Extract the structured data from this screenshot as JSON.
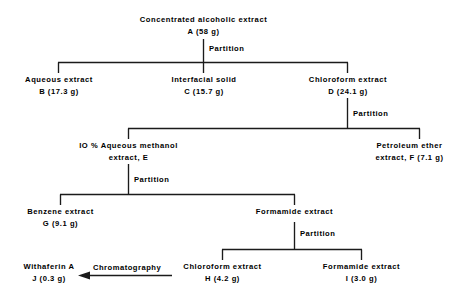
{
  "diagram": {
    "line_color": "#1b1b1b",
    "background": "#ffffff",
    "nodes": [
      {
        "id": "A",
        "line1": "Concentrated  alcoholic  extract",
        "line2": "A (58 g)"
      },
      {
        "id": "B",
        "line1": "Aqueous  extract",
        "line2": "B  (17.3 g)"
      },
      {
        "id": "C",
        "line1": "Interfacial  solid",
        "line2": "C  (15.7 g)"
      },
      {
        "id": "D",
        "line1": "Chloroform  extract",
        "line2": "D  (24.1 g)"
      },
      {
        "id": "E",
        "line1": "IO %  Aqueous  methanol",
        "line2": "extract,   E"
      },
      {
        "id": "F",
        "line1": "Petroleum  ether",
        "line2": "extract,   F  (7.1 g)"
      },
      {
        "id": "G",
        "line1": "Benzene  extract",
        "line2": "G  (9.1 g)"
      },
      {
        "id": "FORM",
        "line1": "Formamide  extract",
        "line2": ""
      },
      {
        "id": "H",
        "line1": "Chloroform  extract",
        "line2": "H  (4.2 g)"
      },
      {
        "id": "I",
        "line1": "Formamide  extract",
        "line2": "I  (3.0 g)"
      },
      {
        "id": "J",
        "line1": "Withaferin  A",
        "line2": "J  (0.3 g)"
      }
    ],
    "edge_labels": {
      "partition_1": "Partition",
      "partition_2": "Partition",
      "partition_3": "Partition",
      "partition_4": "Partition",
      "chromatography": "Chromatography"
    }
  }
}
